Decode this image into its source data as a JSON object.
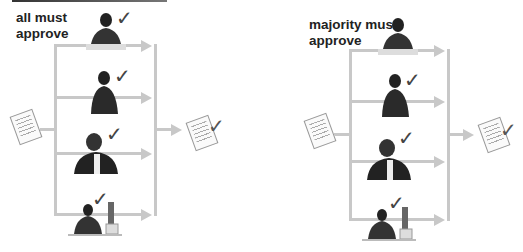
{
  "panels": [
    {
      "id": "all",
      "title_line1": "all must",
      "title_line2": "approve",
      "approvers": [
        {
          "label": "approver-1",
          "approved": true
        },
        {
          "label": "approver-2",
          "approved": true
        },
        {
          "label": "approver-3",
          "approved": true
        },
        {
          "label": "approver-4",
          "approved": true
        }
      ],
      "check_glyph": "✓",
      "output_doc_approved": true
    },
    {
      "id": "majority",
      "title_line1": "majority must",
      "title_line2": "approve",
      "approvers": [
        {
          "label": "approver-1",
          "approved": false
        },
        {
          "label": "approver-2",
          "approved": true
        },
        {
          "label": "approver-3",
          "approved": true
        },
        {
          "label": "approver-4",
          "approved": true
        }
      ],
      "check_glyph": "✓",
      "output_doc_approved": true
    }
  ],
  "colors": {
    "line": "#c8c8c8",
    "title": "#222222",
    "check": "#444444"
  }
}
